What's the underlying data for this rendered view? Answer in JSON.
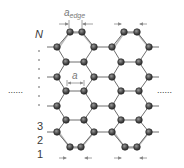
{
  "figure": {
    "type": "armchair-graphene-nanoribbon-schematic",
    "labels": {
      "a_edge": "a",
      "a_edge_subscript": "edge",
      "a": "a",
      "row_top": "N",
      "row_3": "3",
      "row_2": "2",
      "row_1": "1"
    },
    "colors": {
      "atom_fill": "#5a5a5a",
      "atom_stroke": "#2a2a2a",
      "bond": "#777777",
      "relaxed_bond": "#b0b0b0",
      "arrow": "#8a8a8a",
      "text": "#3a3a3a"
    },
    "continuation_marks": {
      "left": "......",
      "right": "......"
    }
  }
}
